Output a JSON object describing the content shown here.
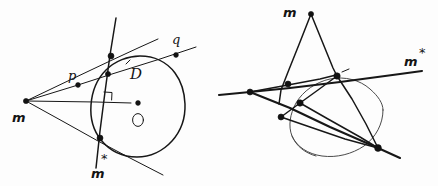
{
  "figure": {
    "kind": "hand-drawn-geometry-diagram",
    "background_color": "#fdfdfd",
    "ink_color": "#171717",
    "panels": [
      {
        "id": "left-panel",
        "name": "pole-and-polar-construction",
        "circle": {
          "cx": 138,
          "cy": 103,
          "r": 47,
          "center_label": "O"
        },
        "labels": [
          {
            "key": "pole",
            "text": "m",
            "x": 12,
            "y": 122
          },
          {
            "key": "point-p",
            "text": "p",
            "x": 68,
            "y": 80
          },
          {
            "key": "point-q",
            "text": "q",
            "x": 172,
            "y": 44
          },
          {
            "key": "polar-line",
            "text": "D",
            "x": 130,
            "y": 79
          },
          {
            "key": "center",
            "text": "O",
            "x": 134,
            "y": 124
          },
          {
            "key": "polar-point",
            "text": "m",
            "x": 91,
            "y": 178
          },
          {
            "key": "polar-point-star",
            "text": "*",
            "x": 101,
            "y": 163
          }
        ]
      },
      {
        "id": "right-panel",
        "name": "projective-dual-construction",
        "circle": {
          "cx": 337,
          "cy": 110,
          "r": 46
        },
        "labels": [
          {
            "key": "apex",
            "text": "m",
            "x": 283,
            "y": 17
          },
          {
            "key": "image-point",
            "text": "m",
            "x": 404,
            "y": 66
          },
          {
            "key": "image-point-star",
            "text": "*",
            "x": 419,
            "y": 57
          }
        ]
      }
    ]
  },
  "legend": {
    "pole_label": "m",
    "polar_label": "D",
    "center_label": "O",
    "tangency_point_labels": [
      "p",
      "q"
    ],
    "star_label": "*"
  }
}
